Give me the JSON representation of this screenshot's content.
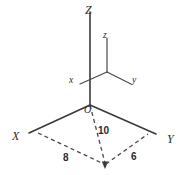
{
  "figure": {
    "background_color": "#ffffff",
    "stroke_color": "#3a3a3a",
    "label_color": "#2b2b2b"
  },
  "axes": {
    "global": [
      {
        "id": "Z",
        "label": "Z",
        "orientation": "vertical-up"
      },
      {
        "id": "X",
        "label": "X",
        "orientation": "down-left"
      },
      {
        "id": "Y",
        "label": "Y",
        "orientation": "down-right"
      }
    ],
    "local": [
      {
        "id": "z",
        "label": "z",
        "orientation": "vertical-up"
      },
      {
        "id": "x",
        "label": "x",
        "orientation": "down-left"
      },
      {
        "id": "y",
        "label": "y",
        "orientation": "down-right"
      }
    ]
  },
  "origin": {
    "label": "O"
  },
  "dimensions": [
    {
      "id": "height",
      "label": "10",
      "style": "dashed-vertical"
    },
    {
      "id": "x-extent",
      "label": "8",
      "style": "dashed"
    },
    {
      "id": "y-extent",
      "label": "6",
      "style": "dashed"
    }
  ],
  "labels": {
    "Z_major": "Z",
    "X_major": "X",
    "Y_major": "Y",
    "z_minor": "z",
    "x_minor": "x",
    "y_minor": "y",
    "origin": "O",
    "dim_10": "10",
    "dim_8": "8",
    "dim_6": "6"
  }
}
